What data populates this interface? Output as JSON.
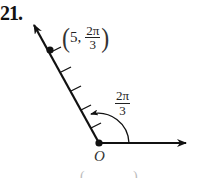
{
  "problem": {
    "number": "21."
  },
  "diagram": {
    "type": "polar-point-plot",
    "point": {
      "r": "5",
      "theta_num": "2π",
      "theta_den": "3",
      "open": "(",
      "comma": ",",
      "close": ")"
    },
    "angle_label": {
      "num": "2π",
      "den": "3"
    },
    "origin_label": "O",
    "tick_count": 5,
    "colors": {
      "ink": "#111111",
      "background": "#ffffff"
    }
  },
  "cropped_bottom": {
    "left": "(",
    "right": ")"
  }
}
